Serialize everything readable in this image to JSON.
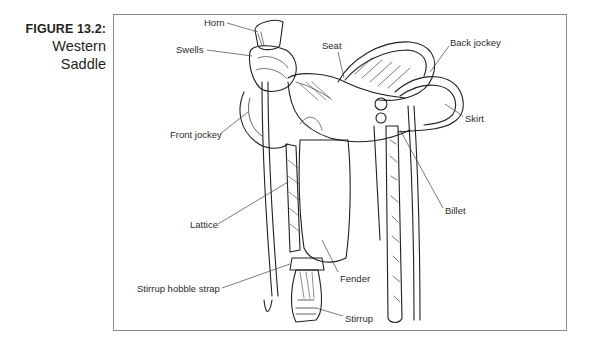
{
  "figure": {
    "number": "FIGURE 13.2:",
    "title_line1": "Western",
    "title_line2": "Saddle"
  },
  "labels": {
    "horn": "Horn",
    "swells": "Swells",
    "seat": "Seat",
    "back_jockey": "Back jockey",
    "skirt": "Skirt",
    "front_jockey": "Front jockey",
    "billet": "Billet",
    "lattice": "Lattice",
    "fender": "Fender",
    "stirrup_hobble_strap": "Stirrup hobble strap",
    "stirrup": "Stirrup"
  },
  "colors": {
    "ink": "#231f20",
    "frame_border": "#8a8a8a",
    "background": "#ffffff"
  }
}
